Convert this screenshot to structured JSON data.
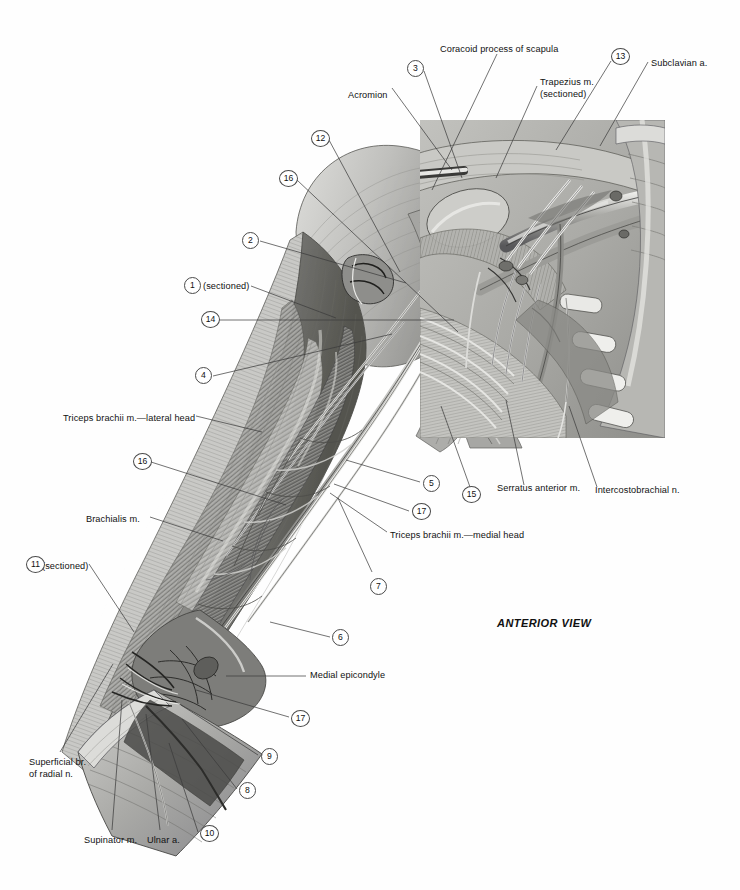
{
  "plate": {
    "view_caption": "ANTERIOR VIEW",
    "background_color": "#fefefe",
    "inset_tone": "#b9b9b6"
  },
  "text_labels": [
    {
      "id": "coracoid",
      "text": "Coracoid process of scapula",
      "x": 440,
      "y": 44,
      "align": "left"
    },
    {
      "id": "acromion",
      "text": "Acromion",
      "x": 348,
      "y": 90,
      "align": "left"
    },
    {
      "id": "trapezius",
      "text": "Trapezius m.",
      "x": 540,
      "y": 77,
      "align": "left"
    },
    {
      "id": "trapezius-sectioned",
      "text": "(sectioned)",
      "x": 540,
      "y": 89,
      "align": "left"
    },
    {
      "id": "subclavian",
      "text": "Subclavian a.",
      "x": 651,
      "y": 58,
      "align": "left"
    },
    {
      "id": "triceps-lateral",
      "text": "Triceps brachii m.—lateral head",
      "x": 63,
      "y": 413,
      "align": "left"
    },
    {
      "id": "brachialis",
      "text": "Brachialis m.",
      "x": 86,
      "y": 514,
      "align": "left"
    },
    {
      "id": "sectioned-11",
      "text": "(sectioned)",
      "x": 42,
      "y": 561,
      "align": "left"
    },
    {
      "id": "sectioned-1",
      "text": "(sectioned)",
      "x": 203,
      "y": 281,
      "align": "left"
    },
    {
      "id": "superficial-radial-1",
      "text": "Superficial br.",
      "x": 29,
      "y": 757,
      "align": "left"
    },
    {
      "id": "superficial-radial-2",
      "text": "of radial n.",
      "x": 29,
      "y": 769,
      "align": "left"
    },
    {
      "id": "supinator",
      "text": "Supinator m.",
      "x": 84,
      "y": 835,
      "align": "left"
    },
    {
      "id": "ulnar-a",
      "text": "Ulnar a.",
      "x": 147,
      "y": 835,
      "align": "left"
    },
    {
      "id": "triceps-medial",
      "text": "Triceps brachii m.—medial head",
      "x": 390,
      "y": 536,
      "align": "left"
    },
    {
      "id": "serratus-anterior",
      "text": "Serratus anterior m.",
      "x": 497,
      "y": 489,
      "align": "left"
    },
    {
      "id": "intercostobrachial",
      "text": "Intercostobrachial n.",
      "x": 595,
      "y": 491,
      "align": "left"
    },
    {
      "id": "medial-epicondyle",
      "text": "Medial epicondyle",
      "x": 310,
      "y": 673,
      "align": "left"
    }
  ],
  "numbered_callouts": [
    {
      "n": "3",
      "x": 407,
      "y": 60
    },
    {
      "n": "13",
      "x": 611,
      "y": 48
    },
    {
      "n": "12",
      "x": 311,
      "y": 130
    },
    {
      "n": "16",
      "x": 279,
      "y": 170
    },
    {
      "n": "2",
      "x": 242,
      "y": 232
    },
    {
      "n": "1",
      "x": 184,
      "y": 277
    },
    {
      "n": "14",
      "x": 201,
      "y": 311
    },
    {
      "n": "4",
      "x": 195,
      "y": 367
    },
    {
      "n": "16",
      "x": 133,
      "y": 453
    },
    {
      "n": "5",
      "x": 423,
      "y": 475
    },
    {
      "n": "15",
      "x": 462,
      "y": 486
    },
    {
      "n": "17",
      "x": 412,
      "y": 503
    },
    {
      "n": "7",
      "x": 370,
      "y": 578
    },
    {
      "n": "11",
      "x": 26,
      "y": 556
    },
    {
      "n": "6",
      "x": 332,
      "y": 629
    },
    {
      "n": "17",
      "x": 291,
      "y": 710
    },
    {
      "n": "9",
      "x": 261,
      "y": 748
    },
    {
      "n": "8",
      "x": 239,
      "y": 782
    },
    {
      "n": "10",
      "x": 200,
      "y": 825
    }
  ],
  "leader_lines": [
    {
      "from": "coracoid",
      "path": "M 497,54 L 430,190"
    },
    {
      "from": "acromion",
      "path": "M 392,88 L 452,168"
    },
    {
      "from": "trapezius",
      "path": "M 536,86 L 495,175"
    },
    {
      "from": "subclavian",
      "path": "M 648,60 L 600,142"
    },
    {
      "from": "circle-3",
      "path": "M 424,70 L 461,176"
    },
    {
      "from": "circle-13",
      "path": "M 610,60 L 553,148"
    },
    {
      "from": "circle-12",
      "path": "M 328,140 L 400,270"
    },
    {
      "from": "circle-16",
      "path": "M 296,180 L 455,330"
    },
    {
      "from": "circle-2",
      "path": "M 259,242 L 405,282"
    },
    {
      "from": "circle-1",
      "path": "M 250,286 L 335,318"
    },
    {
      "from": "circle-14",
      "path": "M 218,320 L 452,320"
    },
    {
      "from": "circle-4",
      "path": "M 212,376 L 390,333"
    },
    {
      "from": "tricepslat",
      "path": "M 195,416 L 261,430"
    },
    {
      "from": "circle16b",
      "path": "M 150,462 L 283,503"
    },
    {
      "from": "brachialis",
      "path": "M 149,517 L 222,540"
    },
    {
      "from": "circle-11",
      "path": "M 88,564 L 133,630"
    },
    {
      "from": "suprad",
      "path": "M 60,752 L 112,664"
    },
    {
      "from": "supinator",
      "path": "M 112,830 L 122,700"
    },
    {
      "from": "ulnar",
      "path": "M 160,830 L 145,713"
    },
    {
      "from": "circle-5",
      "path": "M 421,481 L 345,459"
    },
    {
      "from": "circle-15",
      "path": "M 470,486 L 440,406"
    },
    {
      "from": "circle-17",
      "path": "M 410,510 L 333,483"
    },
    {
      "from": "circle-7",
      "path": "M 372,572 L 337,498"
    },
    {
      "from": "serratus",
      "path": "M 524,485 L 505,400"
    },
    {
      "from": "intercost",
      "path": "M 597,487 L 568,405"
    },
    {
      "from": "tricepsmed",
      "path": "M 388,532 L 330,492"
    },
    {
      "from": "circle-6",
      "path": "M 331,636 L 269,621"
    },
    {
      "from": "medialepi",
      "path": "M 307,676 L 225,676"
    },
    {
      "from": "circle17b",
      "path": "M 290,716 L 196,689"
    },
    {
      "from": "circle-9",
      "path": "M 259,754 L 181,704"
    },
    {
      "from": "circle-8",
      "path": "M 238,788 L 182,718"
    },
    {
      "from": "circle-10",
      "path": "M 199,831 L 169,742"
    }
  ]
}
